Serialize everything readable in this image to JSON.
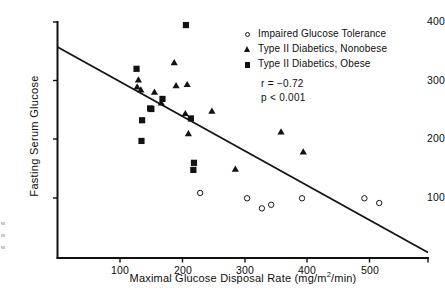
{
  "chart_data": {
    "type": "scatter",
    "title": "",
    "xlabel": "Maximal Glucose Disposal Rate (mg/m2/min)",
    "xlabel_parts": {
      "before": "Maximal Glucose Disposal Rate (mg/m",
      "sup": "2",
      "after": "/min)"
    },
    "ylabel": "Fasting Serum Glucose",
    "xlim": [
      0,
      600
    ],
    "ylim": [
      0,
      400
    ],
    "xticks": [
      100,
      200,
      300,
      400,
      500
    ],
    "yticks": [
      100,
      200,
      300,
      400
    ],
    "grid": false,
    "legend_position": "top-right",
    "annotations": [
      "r = −0.72",
      "p < 0.001"
    ],
    "statistics": {
      "r": "r = −0.72",
      "p": "p < 0.001"
    },
    "trendline": {
      "x": [
        0,
        598
      ],
      "y": [
        352,
        8
      ],
      "style": "solid",
      "color": "#151515"
    },
    "series": [
      {
        "name": "Impaired Glucose Tolerance",
        "marker": "open-circle",
        "color": "#1a1a1a",
        "points": [
          {
            "x": 231,
            "y": 110
          },
          {
            "x": 307,
            "y": 101
          },
          {
            "x": 331,
            "y": 84
          },
          {
            "x": 346,
            "y": 90
          },
          {
            "x": 396,
            "y": 101
          },
          {
            "x": 497,
            "y": 101
          },
          {
            "x": 521,
            "y": 93
          }
        ]
      },
      {
        "name": "Type II Diabetics, Nonobese",
        "marker": "filled-triangle",
        "color": "#121212",
        "points": [
          {
            "x": 129,
            "y": 289
          },
          {
            "x": 131,
            "y": 301
          },
          {
            "x": 135,
            "y": 284
          },
          {
            "x": 157,
            "y": 280
          },
          {
            "x": 168,
            "y": 262
          },
          {
            "x": 189,
            "y": 330
          },
          {
            "x": 192,
            "y": 291
          },
          {
            "x": 210,
            "y": 293
          },
          {
            "x": 207,
            "y": 244
          },
          {
            "x": 212,
            "y": 210
          },
          {
            "x": 250,
            "y": 248
          },
          {
            "x": 288,
            "y": 150
          },
          {
            "x": 362,
            "y": 213
          },
          {
            "x": 398,
            "y": 179
          }
        ]
      },
      {
        "name": "Type II Diabetics, Obese",
        "marker": "filled-square",
        "color": "#121212",
        "points": [
          {
            "x": 128,
            "y": 320
          },
          {
            "x": 137,
            "y": 233
          },
          {
            "x": 136,
            "y": 198
          },
          {
            "x": 150,
            "y": 253
          },
          {
            "x": 152,
            "y": 252
          },
          {
            "x": 170,
            "y": 269
          },
          {
            "x": 208,
            "y": 394
          },
          {
            "x": 216,
            "y": 236
          },
          {
            "x": 221,
            "y": 161
          },
          {
            "x": 220,
            "y": 149
          }
        ]
      }
    ]
  },
  "legend": {
    "entries": [
      {
        "label": "Impaired Glucose Tolerance",
        "marker": "open-circle"
      },
      {
        "label": "Type II Diabetics, Nonobese",
        "marker": "filled-triangle"
      },
      {
        "label": "Type II Diabetics, Obese",
        "marker": "filled-square"
      }
    ]
  }
}
